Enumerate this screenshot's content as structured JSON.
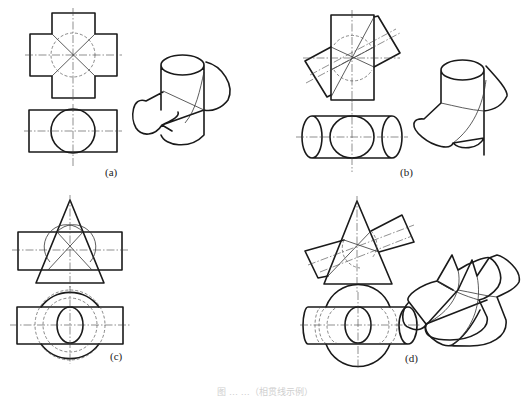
{
  "figure": {
    "caption": "图 … …（相贯线示例）",
    "panels": [
      {
        "id": "a",
        "label": "(a)",
        "label_pos": [
          105,
          172
        ],
        "description": "Two equal cylinders crossing at right angles (cross tee)",
        "shapes": [
          {
            "k": "polyline",
            "c": "thick",
            "p": [
              [
                52,
                34
              ],
              [
                52,
                13
              ],
              [
                95,
                13
              ],
              [
                95,
                34
              ],
              [
                117,
                34
              ],
              [
                117,
                76
              ],
              [
                95,
                76
              ],
              [
                95,
                98
              ],
              [
                52,
                98
              ],
              [
                52,
                76
              ],
              [
                30,
                76
              ],
              [
                30,
                34
              ],
              [
                52,
                34
              ]
            ]
          },
          {
            "k": "line",
            "c": "thin",
            "p": [
              [
                52,
                34
              ],
              [
                95,
                76
              ]
            ]
          },
          {
            "k": "line",
            "c": "thin",
            "p": [
              [
                95,
                34
              ],
              [
                52,
                76
              ]
            ]
          },
          {
            "k": "circle",
            "c": "hidden",
            "cx": 73,
            "cy": 55,
            "r": 22
          },
          {
            "k": "line",
            "c": "center",
            "p": [
              [
                73,
                8
              ],
              [
                73,
                102
              ]
            ]
          },
          {
            "k": "line",
            "c": "center",
            "p": [
              [
                25,
                55
              ],
              [
                122,
                55
              ]
            ]
          },
          {
            "k": "rect",
            "c": "thick",
            "x": 29,
            "y": 110,
            "w": 88,
            "h": 42
          },
          {
            "k": "circle",
            "c": "thick",
            "cx": 73,
            "cy": 131,
            "r": 22
          },
          {
            "k": "line",
            "c": "center",
            "p": [
              [
                73,
                104
              ],
              [
                73,
                166
              ]
            ]
          },
          {
            "k": "line",
            "c": "center",
            "p": [
              [
                24,
                131
              ],
              [
                122,
                131
              ]
            ]
          },
          {
            "k": "path",
            "c": "thick",
            "d": "M161,65 L161,110 M204,65 L204,135 M161,65 A21.5,10 0 1 1 204,65 A21.5,10 0 1 1 161,65 M206,62 C222,66 235,85 228,100 C222,108 212,112 204,110 M163,92 L146,101 M162,125 L172,131 M146,101 C132,96 130,118 136,128 C142,137 155,136 162,125 C170,121 180,117 178,112 M162,125 L204,110 M161,135 C165,146 190,150 204,135"
          },
          {
            "k": "path",
            "c": "thin",
            "d": "M163,91 L204,110 M204,72 C200,90 196,110 185,123"
          }
        ]
      },
      {
        "id": "b",
        "label": "(b)",
        "label_pos": [
          400,
          172
        ],
        "description": "Two equal cylinders intersecting obliquely",
        "shapes": [
          {
            "k": "rect",
            "c": "thick",
            "x": 331,
            "y": 15,
            "w": 43,
            "h": 85
          },
          {
            "k": "polyline",
            "c": "thick",
            "p": [
              [
                331,
                47
              ],
              [
                305,
                61
              ],
              [
                327,
                97
              ],
              [
                331,
                95
              ]
            ]
          },
          {
            "k": "polyline",
            "c": "thick",
            "p": [
              [
                374,
                17
              ],
              [
                378,
                16
              ],
              [
                400,
                53
              ],
              [
                374,
                67
              ]
            ]
          },
          {
            "k": "line",
            "c": "thin",
            "p": [
              [
                331,
                47
              ],
              [
                374,
                67
              ]
            ]
          },
          {
            "k": "line",
            "c": "thin",
            "p": [
              [
                331,
                70
              ],
              [
                374,
                47
              ]
            ]
          },
          {
            "k": "line",
            "c": "thin",
            "p": [
              [
                331,
                97
              ],
              [
                374,
                17
              ]
            ]
          },
          {
            "k": "path",
            "c": "hidden",
            "d": "M334,45 A22,22 0 0 1 372,48 M334,70 A22,22 0 0 0 372,70"
          },
          {
            "k": "line",
            "c": "center",
            "p": [
              [
                352,
                10
              ],
              [
                352,
                104
              ]
            ]
          },
          {
            "k": "line",
            "c": "center",
            "p": [
              [
                303,
                58
              ],
              [
                400,
                58
              ]
            ]
          },
          {
            "k": "line",
            "c": "center",
            "p": [
              [
                306,
                83
              ],
              [
                400,
                33
              ]
            ]
          },
          {
            "k": "line",
            "c": "center",
            "p": [
              [
                310,
                75
              ],
              [
                396,
                29
              ]
            ]
          },
          {
            "k": "path",
            "c": "thick",
            "d": "M312,116 L392,116 M312,158 L392,158 M312,116 A10,21 0 1 0 312,158 A10,21 0 1 0 312,116 M392,116 A10,21 0 1 0 392,158 A10,21 0 1 0 392,116"
          },
          {
            "k": "ellipse",
            "c": "thick",
            "cx": 352,
            "cy": 137,
            "rx": 22,
            "ry": 21
          },
          {
            "k": "line",
            "c": "center",
            "p": [
              [
                352,
                103
              ],
              [
                352,
                172
              ]
            ]
          },
          {
            "k": "line",
            "c": "center",
            "p": [
              [
                296,
                137
              ],
              [
                408,
                137
              ]
            ]
          },
          {
            "k": "path",
            "c": "thick",
            "d": "M441,70 L441,103 M484,70 L484,155 M441,70 A21.5,10 0 1 1 484,70 A21.5,10 0 1 1 441,70 M486,66 C497,78 508,90 507,96 C502,106 494,110 484,111 M441,103 L424,119 M424,119 A22,10 30 1 0 453,143 M453,143 L484,138 M453,143 C460,150 478,150 484,138"
          },
          {
            "k": "path",
            "c": "thin",
            "d": "M441,103 C455,106 470,110 484,111 M486,80 C483,105 473,128 453,143"
          }
        ]
      },
      {
        "id": "c",
        "label": "(c)",
        "label_pos": [
          110,
          356
        ],
        "description": "Horizontal cylinder intersecting a vertical cone (axes perpendicular)",
        "shapes": [
          {
            "k": "polyline",
            "c": "thick",
            "p": [
              [
                70,
                200
              ],
              [
                36,
                283
              ],
              [
                104,
                283
              ],
              [
                70,
                200
              ]
            ]
          },
          {
            "k": "rect",
            "c": "thick",
            "x": 18,
            "y": 232,
            "w": 104,
            "h": 38
          },
          {
            "k": "line",
            "c": "thin",
            "p": [
              [
                57,
                232
              ],
              [
                92,
                270
              ]
            ]
          },
          {
            "k": "line",
            "c": "thin",
            "p": [
              [
                83,
                232
              ],
              [
                48,
                270
              ]
            ]
          },
          {
            "k": "path",
            "c": "thin",
            "d": "M57,232 A22,22 0 0 1 90,262 M83,232 A22,22 0 0 0 50,262"
          },
          {
            "k": "line",
            "c": "hidden",
            "p": [
              [
                44,
                270
              ],
              [
                98,
                270
              ]
            ]
          },
          {
            "k": "line",
            "c": "center",
            "p": [
              [
                70,
                195
              ],
              [
                70,
                290
              ]
            ]
          },
          {
            "k": "line",
            "c": "center",
            "p": [
              [
                12,
                250
              ],
              [
                128,
                250
              ]
            ]
          },
          {
            "k": "path",
            "c": "thick",
            "d": "M41,307 A36,36 0 0 1 99,307 M41,344 A36,36 0 0 0 99,344"
          },
          {
            "k": "rect",
            "c": "thick",
            "x": 17,
            "y": 307,
            "w": 106,
            "h": 37
          },
          {
            "k": "ellipse",
            "c": "thick",
            "cx": 70,
            "cy": 325,
            "rx": 13,
            "ry": 18
          },
          {
            "k": "circle",
            "c": "hidden",
            "cx": 70,
            "cy": 325,
            "r": 27
          },
          {
            "k": "circle",
            "c": "hidden",
            "cx": 70,
            "cy": 325,
            "r": 35
          },
          {
            "k": "line",
            "c": "center",
            "p": [
              [
                70,
                286
              ],
              [
                70,
                364
              ]
            ]
          },
          {
            "k": "line",
            "c": "center",
            "p": [
              [
                10,
                325
              ],
              [
                130,
                325
              ]
            ]
          },
          {
            "k": "path",
            "c": "thick",
            "d": "M453,225 M452,255 L437,281 M452,255 L458,270 M437,281 L453,290 M458,270 C470,262 487,256 490,258 C497,262 505,277 498,287 C493,294 485,299 479,300 M437,281 C423,284 403,296 409,302 M409,302 L426,324 M409,302 C401,310 400,325 410,328 C418,332 425,328 426,324 M479,300 L487,317 C490,330 470,340 450,340 C435,340 422,337 426,324 M426,324 L487,300"
          },
          {
            "k": "path",
            "c": "thin",
            "d": "M437,281 C450,290 465,296 479,300 M458,270 C463,292 450,312 426,324"
          }
        ]
      },
      {
        "id": "d",
        "label": "(d)",
        "label_pos": [
          405,
          358
        ],
        "description": "Inclined cylinder intersecting a vertical cone",
        "shapes": [
          {
            "k": "polyline",
            "c": "thick",
            "p": [
              [
                357,
                201
              ],
              [
                324,
                284
              ],
              [
                392,
                284
              ],
              [
                357,
                201
              ]
            ]
          },
          {
            "k": "polyline",
            "c": "thick",
            "p": [
              [
                344,
                240
              ],
              [
                305,
                251
              ],
              [
                318,
                278
              ],
              [
                328,
                276
              ]
            ]
          },
          {
            "k": "polyline",
            "c": "thick",
            "p": [
              [
                371,
                231
              ],
              [
                402,
                215
              ],
              [
                414,
                242
              ],
              [
                379,
                252
              ]
            ]
          },
          {
            "k": "line",
            "c": "thin",
            "p": [
              [
                344,
                240
              ],
              [
                379,
                252
              ]
            ]
          },
          {
            "k": "line",
            "c": "thin",
            "p": [
              [
                328,
                276
              ],
              [
                371,
                231
              ]
            ]
          },
          {
            "k": "path",
            "c": "hidden",
            "d": "M344,240 A20,20 0 0 0 360,268 M371,231 A20,20 0 0 1 372,258"
          },
          {
            "k": "line",
            "c": "center",
            "p": [
              [
                357,
                196
              ],
              [
                357,
                292
              ]
            ]
          },
          {
            "k": "line",
            "c": "center",
            "p": [
              [
                308,
                265
              ],
              [
                414,
                225
              ]
            ]
          },
          {
            "k": "line",
            "c": "center",
            "p": [
              [
                320,
                272
              ],
              [
                412,
                236
              ]
            ]
          },
          {
            "k": "path",
            "c": "thick",
            "d": "M326,307 A34,34 0 0 1 390,307 M326,344 A34,34 0 0 0 390,344"
          },
          {
            "k": "path",
            "c": "thick",
            "d": "M308,307 L408,307 M308,344 L408,344 M308,307 A5,18.5 0 0 0 308,344 M408,307 A9,18.5 0 1 0 408,344 A9,18.5 0 1 0 408,307"
          },
          {
            "k": "ellipse",
            "c": "thick",
            "cx": 358,
            "cy": 325,
            "rx": 13,
            "ry": 18
          },
          {
            "k": "path",
            "c": "hidden",
            "d": "M322,307 A7,18.5 0 0 0 322,344 M328,307 A9,18.5 0 0 0 328,344 M340,307 A13,18.5 0 0 0 340,344 M376,307 A13,18.5 0 0 1 376,344 M388,307 A9,18.5 0 0 1 388,344"
          },
          {
            "k": "line",
            "c": "center",
            "p": [
              [
                358,
                292
              ],
              [
                358,
                368
              ]
            ]
          },
          {
            "k": "line",
            "c": "center",
            "p": [
              [
                300,
                325
              ],
              [
                420,
                325
              ]
            ]
          },
          {
            "k": "path",
            "c": "thick",
            "d": "M472,260 L458,290 M472,260 L477,276 M477,276 L489,258 L497,255 C505,257 522,270 519,282 C516,288 508,292 497,297 M458,290 L428,323 M428,323 A16,8 35 1 0 452,345 M452,345 C460,340 470,330 480,310 M497,297 L506,320 C508,337 490,346 470,346 C455,346 448,346 452,345"
          },
          {
            "k": "path",
            "c": "thin",
            "d": "M458,290 C470,292 485,296 497,297 M477,276 C482,300 475,328 452,345"
          }
        ]
      }
    ]
  },
  "style": {
    "line_color": "#1a1a1a",
    "background": "#ffffff"
  }
}
